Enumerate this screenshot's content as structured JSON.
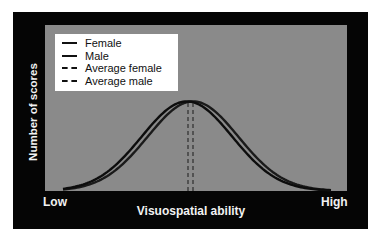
{
  "chart_data": {
    "type": "line",
    "title": "",
    "xlabel": "Visuospatial ability",
    "ylabel": "Number of scores",
    "x_tick_labels": [
      "Low",
      "High"
    ],
    "grid": false,
    "legend_position": "upper-left",
    "legend": [
      "Female",
      "Male",
      "Average female",
      "Average male"
    ],
    "series": [
      {
        "name": "Female",
        "style": "solid",
        "distribution": "normal",
        "mean": 0.47,
        "relative_sd": 0.15,
        "peak_relative_height": 0.54
      },
      {
        "name": "Male",
        "style": "solid",
        "distribution": "normal",
        "mean": 0.49,
        "relative_sd": 0.15,
        "peak_relative_height": 0.54
      },
      {
        "name": "Average female",
        "style": "dashed",
        "type": "vertical_line",
        "x": 0.475
      },
      {
        "name": "Average male",
        "style": "dashed",
        "type": "vertical_line",
        "x": 0.49
      }
    ],
    "xlim": [
      "Low",
      "High"
    ],
    "colors": {
      "frame": "#050505",
      "plot_background": "#8a8a8a",
      "lines": "#111111",
      "text": "#f2f2f2"
    }
  },
  "axes": {
    "ylabel": "Number of scores",
    "xlabel": "Visuospatial ability",
    "x_low": "Low",
    "x_high": "High"
  },
  "legend": {
    "items": [
      {
        "label": "Female",
        "style": "solid"
      },
      {
        "label": "Male",
        "style": "solid"
      },
      {
        "label": "Average female",
        "style": "dashed"
      },
      {
        "label": "Average male",
        "style": "dashed"
      }
    ]
  }
}
